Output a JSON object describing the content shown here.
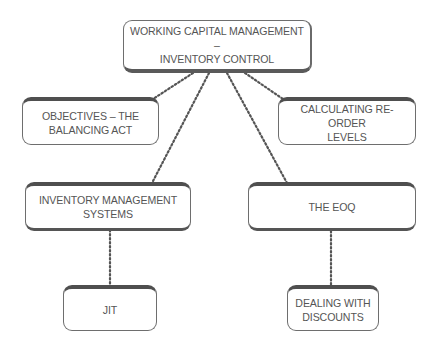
{
  "diagram": {
    "type": "concept-map",
    "root": {
      "id": "root",
      "label_line1": "WORKING CAPITAL MANAGEMENT –",
      "label_line2": "INVENTORY CONTROL"
    },
    "nodes": {
      "objectives": {
        "label_line1": "OBJECTIVES – THE",
        "label_line2": "BALANCING ACT"
      },
      "reorder": {
        "label_line1": "CALCULATING RE-ORDER",
        "label_line2": "LEVELS"
      },
      "ims": {
        "label_line1": "INVENTORY MANAGEMENT",
        "label_line2": "SYSTEMS"
      },
      "eoq": {
        "label_line1": "THE EOQ"
      },
      "jit": {
        "label_line1": "JIT"
      },
      "discounts": {
        "label_line1": "DEALING WITH",
        "label_line2": "DISCOUNTS"
      }
    },
    "edges": [
      {
        "from": "root",
        "to": "objectives",
        "style": "dotted"
      },
      {
        "from": "root",
        "to": "reorder",
        "style": "dotted"
      },
      {
        "from": "root",
        "to": "ims",
        "style": "dotted"
      },
      {
        "from": "root",
        "to": "eoq",
        "style": "dotted"
      },
      {
        "from": "ims",
        "to": "jit",
        "style": "dotted"
      },
      {
        "from": "eoq",
        "to": "discounts",
        "style": "dotted"
      }
    ],
    "colors": {
      "text": "#555555",
      "border": "#6e6e6e",
      "shadow": "#4f4f4f",
      "connector": "#555555",
      "background": "#ffffff"
    }
  }
}
